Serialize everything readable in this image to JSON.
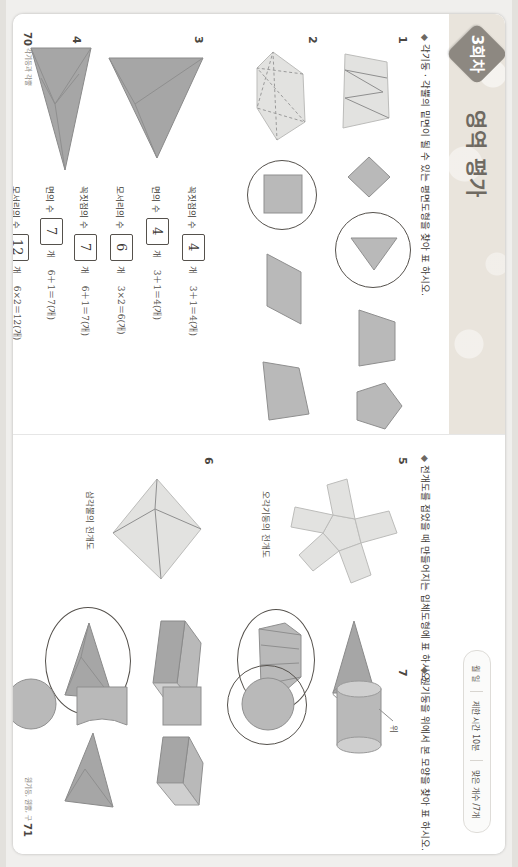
{
  "document": {
    "band_title": "영역 평가",
    "badge_label": "3회차",
    "header": {
      "date_label": "월    일",
      "time_label": "제한 시간 10분",
      "score_label": "맞은 개수      /7개"
    }
  },
  "left_page": {
    "page_number": "70",
    "footer_caption": "각기둥과 각뿔",
    "instruction": "각기둥ㆍ각뿔의 밑면이 될 수 있는 평면도형을 찾아     표 하시오.",
    "instruction_marker": "◆",
    "questions": [
      {
        "number": "1"
      },
      {
        "number": "2"
      },
      {
        "number": "3"
      },
      {
        "number": "4"
      }
    ],
    "q3": {
      "rows": [
        {
          "label": "꼭짓점의 수",
          "answer": "4",
          "unit": "개",
          "equation": "3＋1＝4(개)"
        },
        {
          "label": "면의 수",
          "answer": "4",
          "unit": "개",
          "equation": "3＋1＝4(개)"
        },
        {
          "label": "모서리의 수",
          "answer": "6",
          "unit": "개",
          "equation": "3×2＝6(개)"
        }
      ]
    },
    "q4": {
      "rows": [
        {
          "label": "꼭짓점의 수",
          "answer": "7",
          "unit": "개",
          "equation": "6＋1＝7(개)"
        },
        {
          "label": "면의 수",
          "answer": "7",
          "unit": "개",
          "equation": "6＋1＝7(개)"
        },
        {
          "label": "모서리의 수",
          "answer": "12",
          "unit": "개",
          "equation": "6×2＝12(개)"
        }
      ]
    }
  },
  "right_page": {
    "page_number": "71",
    "footer_caption": "원기둥, 원뿔, 구",
    "instruction_1": "전개도를 접었을 때 만들어지는 입체도형에     표 하시오.",
    "instruction_2": "원기둥을 위에서 본 모양을 찾아     표 하시오.",
    "instruction_marker": "◆",
    "questions": [
      {
        "number": "5",
        "caption": "오각기둥의 전개도"
      },
      {
        "number": "6",
        "caption": "삼각뿔의 전개도"
      },
      {
        "number": "7",
        "caption": "위"
      }
    ]
  },
  "colors": {
    "band": "#e9e4dc",
    "badge": "#8d8881",
    "shape_fill": "#b9b9b9",
    "shape_stroke": "#8f8f8f",
    "ink": "#3b3733"
  }
}
